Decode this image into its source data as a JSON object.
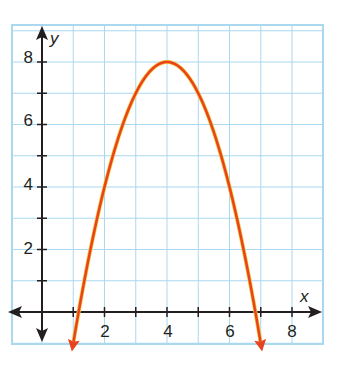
{
  "chart_data": {
    "type": "line",
    "title": "",
    "xlabel": "x",
    "ylabel": "y",
    "xlim": [
      -1,
      9
    ],
    "ylim": [
      -1,
      9
    ],
    "grid": true,
    "x_ticks": [
      1,
      2,
      3,
      4,
      5,
      6,
      7,
      8
    ],
    "x_tick_labels": [
      "2",
      "4",
      "6",
      "8"
    ],
    "y_ticks": [
      1,
      2,
      3,
      4,
      5,
      6,
      7,
      8
    ],
    "y_tick_labels": [
      "2",
      "4",
      "6",
      "8"
    ],
    "series": [
      {
        "name": "parabola",
        "equation": "y = -(x - 4)^2 + 8",
        "vertex": [
          4,
          8
        ],
        "x_intercepts": [
          1.17,
          6.83
        ],
        "x": [
          1,
          1.17,
          2,
          3,
          4,
          5,
          6,
          6.83,
          7
        ],
        "values": [
          -1,
          0,
          4,
          7,
          8,
          7,
          4,
          0,
          -1
        ],
        "color": "#e8431f",
        "arrows_at_ends": true
      }
    ]
  },
  "colors": {
    "grid": "#a9d8ef",
    "axis": "#231f20",
    "curve": "#e8431f",
    "curve_highlight": "#f6c63a"
  },
  "labels": {
    "x_axis": "x",
    "y_axis": "y",
    "x2": "2",
    "x4": "4",
    "x6": "6",
    "x8": "8",
    "y2": "2",
    "y4": "4",
    "y6": "6",
    "y8": "8"
  }
}
